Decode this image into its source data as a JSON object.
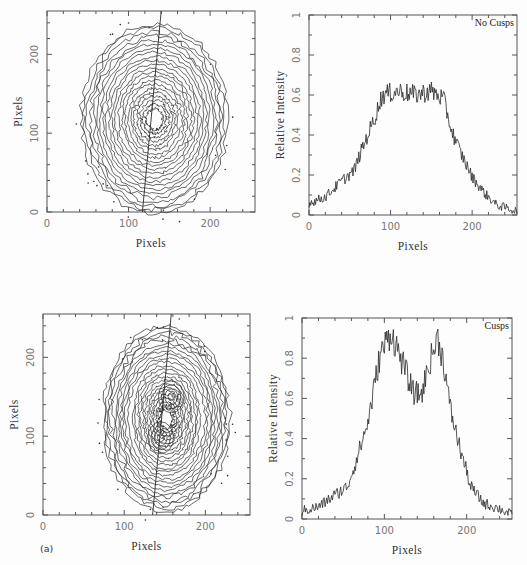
{
  "figure": {
    "panel_label": "(a)",
    "colors": {
      "line": "#2a2a2a",
      "frame": "#555555",
      "tick_text": "#777777"
    }
  },
  "chart_data": [
    {
      "id": "top-left",
      "type": "contour",
      "title": "",
      "xlabel": "Pixels",
      "ylabel": "Pixels",
      "xlim": [
        0,
        255
      ],
      "ylim": [
        0,
        255
      ],
      "xticks": [
        0,
        100,
        200
      ],
      "yticks": [
        0,
        100,
        200
      ],
      "frame": {
        "x": 47,
        "y": 11,
        "w": 208,
        "h": 201
      },
      "contour_center": [
        132,
        118
      ],
      "contour_radii": [
        90,
        120
      ],
      "contour_levels": 22,
      "cusps": false,
      "cut_line": {
        "x0": 117,
        "y0": 0,
        "x1": 140,
        "y1": 255
      }
    },
    {
      "id": "top-right",
      "type": "line",
      "title": "",
      "annotation": "No Cusps",
      "xlabel": "Pixels",
      "ylabel": "Relative Intensity",
      "xlim": [
        0,
        255
      ],
      "ylim": [
        0,
        1
      ],
      "xticks": [
        0,
        100,
        200
      ],
      "yticks": [
        0,
        0.2,
        0.4,
        0.6,
        0.8,
        1
      ],
      "ytick_labels": [
        "0",
        "0.2",
        "0.4",
        "0.6",
        "0.8",
        "1"
      ],
      "frame": {
        "x": 309,
        "y": 15,
        "w": 208,
        "h": 200
      },
      "profile_knots": [
        [
          0,
          0.06
        ],
        [
          20,
          0.09
        ],
        [
          40,
          0.17
        ],
        [
          55,
          0.22
        ],
        [
          65,
          0.33
        ],
        [
          80,
          0.48
        ],
        [
          90,
          0.6
        ],
        [
          110,
          0.62
        ],
        [
          130,
          0.6
        ],
        [
          150,
          0.62
        ],
        [
          165,
          0.58
        ],
        [
          175,
          0.42
        ],
        [
          185,
          0.32
        ],
        [
          200,
          0.19
        ],
        [
          215,
          0.11
        ],
        [
          230,
          0.05
        ],
        [
          255,
          0.02
        ]
      ],
      "noise_amplitude": 0.05
    },
    {
      "id": "bottom-left",
      "type": "contour",
      "title": "",
      "xlabel": "Pixels",
      "ylabel": "Pixels",
      "xlim": [
        0,
        255
      ],
      "ylim": [
        0,
        255
      ],
      "xticks": [
        0,
        100,
        200
      ],
      "yticks": [
        0,
        100,
        200
      ],
      "frame": {
        "x": 43,
        "y": 314,
        "w": 207,
        "h": 201
      },
      "contour_center": [
        152,
        122
      ],
      "contour_radii": [
        78,
        118
      ],
      "contour_levels": 24,
      "cusps": true,
      "cusp_centers": [
        [
          145,
          98
        ],
        [
          158,
          150
        ]
      ],
      "cut_line": {
        "x0": 135,
        "y0": 0,
        "x1": 158,
        "y1": 255
      }
    },
    {
      "id": "bottom-right",
      "type": "line",
      "title": "",
      "annotation": "Cusps",
      "xlabel": "Pixels",
      "ylabel": "Relative Intensity",
      "xlim": [
        0,
        255
      ],
      "ylim": [
        0,
        1
      ],
      "xticks": [
        0,
        100,
        200
      ],
      "yticks": [
        0,
        0.2,
        0.4,
        0.6,
        0.8,
        1
      ],
      "ytick_labels": [
        "0",
        "0.2",
        "0.4",
        "0.6",
        "0.8",
        "1"
      ],
      "frame": {
        "x": 302,
        "y": 318,
        "w": 210,
        "h": 201
      },
      "profile_knots": [
        [
          0,
          0.04
        ],
        [
          20,
          0.06
        ],
        [
          40,
          0.12
        ],
        [
          55,
          0.16
        ],
        [
          65,
          0.28
        ],
        [
          80,
          0.48
        ],
        [
          95,
          0.82
        ],
        [
          108,
          0.93
        ],
        [
          120,
          0.8
        ],
        [
          135,
          0.63
        ],
        [
          145,
          0.62
        ],
        [
          155,
          0.78
        ],
        [
          165,
          0.9
        ],
        [
          172,
          0.78
        ],
        [
          180,
          0.55
        ],
        [
          190,
          0.38
        ],
        [
          205,
          0.16
        ],
        [
          220,
          0.08
        ],
        [
          240,
          0.05
        ],
        [
          255,
          0.02
        ]
      ],
      "noise_amplitude": 0.06
    }
  ]
}
